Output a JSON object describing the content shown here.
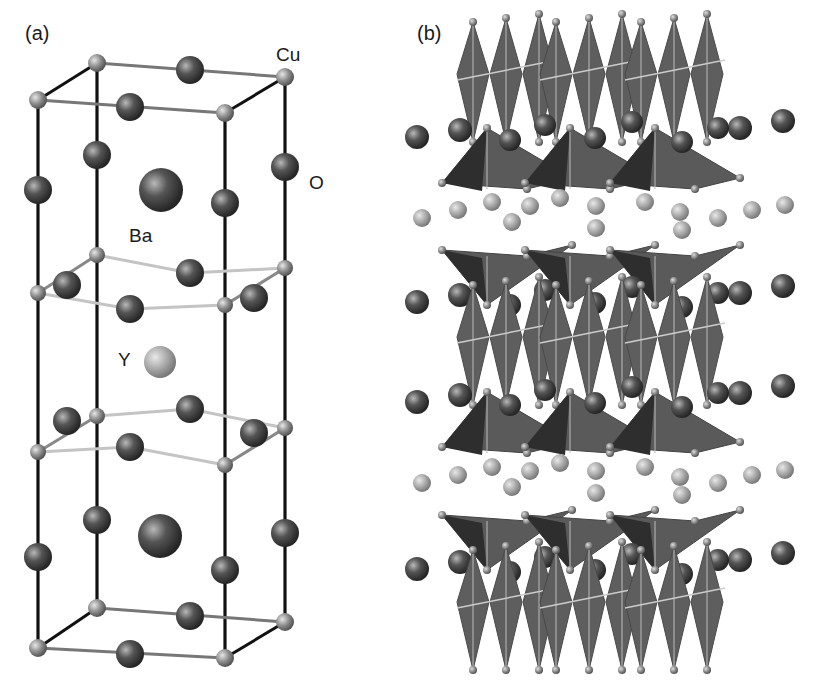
{
  "figure": {
    "panel_a": {
      "label": "(a)",
      "atom_labels": {
        "cu": "Cu",
        "o": "O",
        "ba": "Ba",
        "y": "Y"
      }
    },
    "panel_b": {
      "label": "(b)"
    }
  },
  "colors": {
    "background": "#ffffff",
    "bond_dark": "#111111",
    "bond_light": "#bdbdbd",
    "cu_atom": "#9a9a9a",
    "o_atom": "#4a4a4a",
    "ba_atom": "#555555",
    "y_atom": "#a8a8a8",
    "polyhedron_face": "#5c5c5c",
    "polyhedron_dark": "#2e2e2e"
  }
}
